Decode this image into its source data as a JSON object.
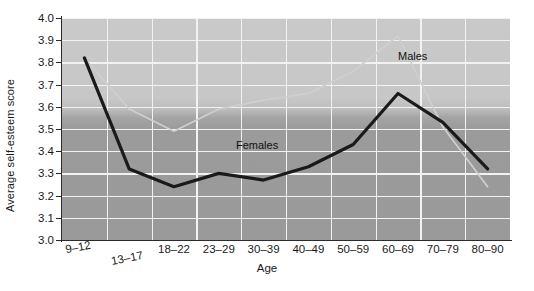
{
  "chart_data": {
    "type": "line",
    "title": "",
    "xlabel": "Age",
    "ylabel": "Average self-esteem score",
    "categories": [
      "9–12",
      "13–17",
      "18–22",
      "23–29",
      "30–39",
      "40–49",
      "50–59",
      "60–69",
      "70–79",
      "80–90"
    ],
    "ylim": [
      3.0,
      4.0
    ],
    "ytick_labels": [
      "3.0",
      "3.1",
      "3.2",
      "3.3",
      "3.4",
      "3.5",
      "3.6",
      "3.7",
      "3.8",
      "3.9",
      "4.0"
    ],
    "ytick_values": [
      3.0,
      3.1,
      3.2,
      3.3,
      3.4,
      3.5,
      3.6,
      3.7,
      3.8,
      3.9,
      4.0
    ],
    "grid": true,
    "legend_position": "inline-annotations",
    "series": [
      {
        "name": "Males",
        "color": "#cfcfcf",
        "values": [
          3.82,
          3.59,
          3.49,
          3.59,
          3.63,
          3.66,
          3.76,
          3.92,
          3.51,
          3.24
        ]
      },
      {
        "name": "Females",
        "color": "#1a1a1a",
        "values": [
          3.82,
          3.32,
          3.24,
          3.3,
          3.27,
          3.33,
          3.43,
          3.66,
          3.53,
          3.32
        ]
      }
    ],
    "annotations": [
      {
        "text": "Males",
        "x": "between 60–69 and 70–79",
        "y": 3.85
      },
      {
        "text": "Females",
        "x": "between 40–49 and 50–59",
        "y": 3.44
      }
    ]
  },
  "colors": {
    "plot_background_top": "#c9c9c9",
    "plot_background_bottom": "#9a9a9a",
    "gridline": "#f2f2f2",
    "axis": "#2b2b2b",
    "males_line": "#cfcfcf",
    "females_line": "#1a1a1a",
    "page_background": "#ffffff"
  }
}
